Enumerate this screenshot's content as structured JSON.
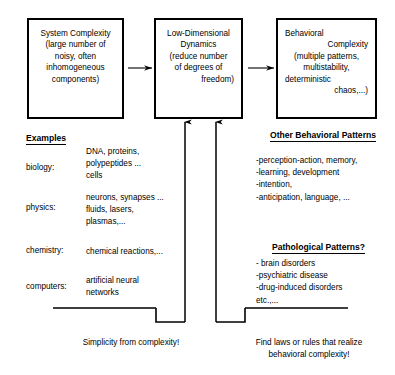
{
  "boxes": {
    "system": {
      "lines": [
        "System Complexity",
        "(large number of",
        "noisy, often",
        "inhomogeneous",
        "components)"
      ]
    },
    "lowdim": {
      "lines": [
        "Low-Dimensional",
        "Dynamics",
        "(reduce number",
        "of degrees of",
        "freedom)"
      ]
    },
    "behavioral": {
      "lines": [
        "Behavioral",
        "Complexity",
        "(multiple patterns,",
        "multistability,",
        "deterministic",
        "chaos,...)"
      ]
    }
  },
  "examples": {
    "heading": "Examples",
    "rows": [
      {
        "label": "biology:",
        "items": [
          "DNA, proteins,",
          "polypeptides ...",
          "cells"
        ]
      },
      {
        "label": "physics:",
        "items": [
          "neurons, synapses ...",
          "fluids, lasers,",
          "plasmas,..."
        ]
      },
      {
        "label": "chemistry:",
        "items": [
          "chemical reactions,..."
        ]
      },
      {
        "label": "computers:",
        "items": [
          "artificial neural",
          "networks"
        ]
      }
    ]
  },
  "other_behavioral": {
    "heading": "Other Behavioral Patterns",
    "items": [
      "-perception-action, memory,",
      "-learning, development",
      "-intention,",
      "-anticipation, language, ..."
    ]
  },
  "pathological": {
    "heading": "Pathological Patterns?",
    "items": [
      "- brain disorders",
      "-psychiatric disease",
      "-drug-induced disorders",
      "etc.,..."
    ]
  },
  "captions": {
    "left": [
      "Simplicity from complexity!"
    ],
    "right": [
      "Find laws or rules that realize",
      "behavioral complexity!"
    ]
  },
  "colors": {
    "stroke": "#000000",
    "background": "#ffffff"
  }
}
